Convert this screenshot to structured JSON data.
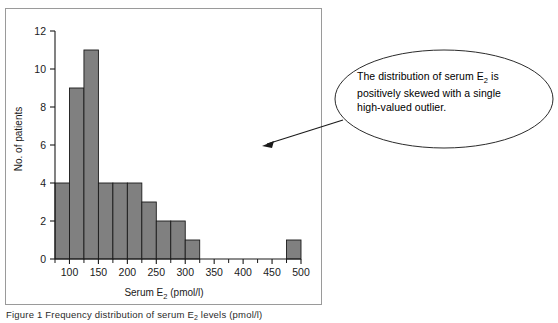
{
  "figure": {
    "caption": "Figure 1  Frequency distribution of serum E",
    "caption_sub": "2",
    "caption_tail": " levels (pmol/l)"
  },
  "annotation": {
    "line1": "The distribution of serum E",
    "sub": "2",
    "line1_tail": " is",
    "line2": "positively skewed with a single",
    "line3": "high-valued outlier.",
    "shape": "ellipse",
    "arrow": "arrow-pointing-to-outlier"
  },
  "chart_data": {
    "type": "bar",
    "title": "",
    "xlabel": "Serum E2 (pmol/l)",
    "xlabel_main": "Serum E",
    "xlabel_sub": "2",
    "xlabel_tail": " (pmol/l)",
    "ylabel": "No. of patients",
    "xlim": [
      75,
      500
    ],
    "ylim": [
      0,
      12
    ],
    "grid": false,
    "legend": "none",
    "bin_width": 25,
    "bar_color": "#808080",
    "bar_edge_color": "#1a1a1a",
    "axis_color": "#1a1a1a",
    "x_ticks": [
      100,
      150,
      200,
      250,
      300,
      350,
      400,
      450,
      500
    ],
    "x_tick_labels": [
      "100",
      "150",
      "200",
      "250",
      "300",
      "350",
      "400",
      "450",
      "500"
    ],
    "x_minor_ticks": [
      75,
      125,
      175,
      225,
      275,
      325,
      375,
      425,
      475
    ],
    "y_ticks": [
      0,
      2,
      4,
      6,
      8,
      10,
      12
    ],
    "y_tick_labels": [
      "0",
      "2",
      "4",
      "6",
      "8",
      "10",
      "12"
    ],
    "bins": [
      {
        "start": 75,
        "end": 100,
        "value": 4
      },
      {
        "start": 100,
        "end": 125,
        "value": 9
      },
      {
        "start": 125,
        "end": 150,
        "value": 11
      },
      {
        "start": 150,
        "end": 175,
        "value": 4
      },
      {
        "start": 175,
        "end": 200,
        "value": 4
      },
      {
        "start": 200,
        "end": 225,
        "value": 4
      },
      {
        "start": 225,
        "end": 250,
        "value": 3
      },
      {
        "start": 250,
        "end": 275,
        "value": 2
      },
      {
        "start": 275,
        "end": 300,
        "value": 2
      },
      {
        "start": 300,
        "end": 325,
        "value": 1
      },
      {
        "start": 325,
        "end": 350,
        "value": 0
      },
      {
        "start": 350,
        "end": 375,
        "value": 0
      },
      {
        "start": 375,
        "end": 400,
        "value": 0
      },
      {
        "start": 400,
        "end": 425,
        "value": 0
      },
      {
        "start": 425,
        "end": 450,
        "value": 0
      },
      {
        "start": 450,
        "end": 475,
        "value": 0
      },
      {
        "start": 475,
        "end": 500,
        "value": 1
      }
    ],
    "categories": [
      "75-100",
      "100-125",
      "125-150",
      "150-175",
      "175-200",
      "200-225",
      "225-250",
      "250-275",
      "275-300",
      "300-325",
      "325-350",
      "350-375",
      "375-400",
      "400-425",
      "425-450",
      "450-475",
      "475-500"
    ],
    "values": [
      4,
      9,
      11,
      4,
      4,
      4,
      3,
      2,
      2,
      1,
      0,
      0,
      0,
      0,
      0,
      0,
      1
    ]
  }
}
